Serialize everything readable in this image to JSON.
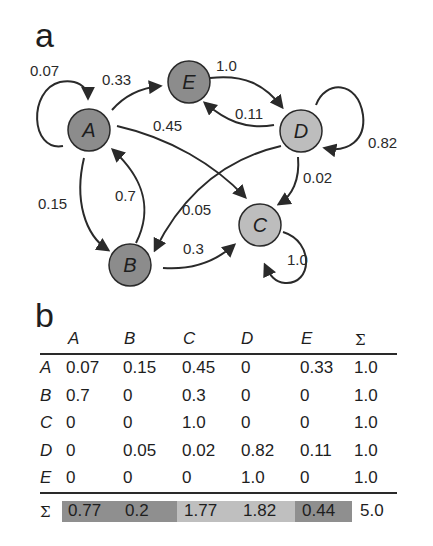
{
  "panels": {
    "a_label": "a",
    "b_label": "b"
  },
  "colors": {
    "node_dark": "#8c8c8c",
    "node_light": "#bdbdbd",
    "stroke": "#2a2a2a",
    "sum_dark": "#8f8f8f",
    "sum_light": "#bfbfbf"
  },
  "graph": {
    "nodes": [
      {
        "id": "A",
        "label": "A",
        "shade": "dark"
      },
      {
        "id": "B",
        "label": "B",
        "shade": "dark"
      },
      {
        "id": "C",
        "label": "C",
        "shade": "light"
      },
      {
        "id": "D",
        "label": "D",
        "shade": "light"
      },
      {
        "id": "E",
        "label": "E",
        "shade": "dark"
      }
    ],
    "edges": [
      {
        "from": "A",
        "to": "A",
        "weight": "0.07"
      },
      {
        "from": "A",
        "to": "E",
        "weight": "0.33"
      },
      {
        "from": "A",
        "to": "C",
        "weight": "0.45"
      },
      {
        "from": "A",
        "to": "B",
        "weight": "0.15"
      },
      {
        "from": "B",
        "to": "A",
        "weight": "0.7"
      },
      {
        "from": "B",
        "to": "C",
        "weight": "0.3"
      },
      {
        "from": "C",
        "to": "C",
        "weight": "1.0"
      },
      {
        "from": "D",
        "to": "D",
        "weight": "0.82"
      },
      {
        "from": "D",
        "to": "E",
        "weight": "0.11"
      },
      {
        "from": "D",
        "to": "C",
        "weight": "0.02"
      },
      {
        "from": "D",
        "to": "B",
        "weight": "0.05"
      },
      {
        "from": "E",
        "to": "D",
        "weight": "1.0"
      }
    ]
  },
  "table": {
    "headers": [
      "A",
      "B",
      "C",
      "D",
      "E",
      "Σ"
    ],
    "rows": [
      {
        "label": "A",
        "values": [
          "0.07",
          "0.15",
          "0.45",
          "0",
          "0.33",
          "1.0"
        ]
      },
      {
        "label": "B",
        "values": [
          "0.7",
          "0",
          "0.3",
          "0",
          "0",
          "1.0"
        ]
      },
      {
        "label": "C",
        "values": [
          "0",
          "0",
          "1.0",
          "0",
          "0",
          "1.0"
        ]
      },
      {
        "label": "D",
        "values": [
          "0",
          "0.05",
          "0.02",
          "0.82",
          "0.11",
          "1.0"
        ]
      },
      {
        "label": "E",
        "values": [
          "0",
          "0",
          "0",
          "1.0",
          "0",
          "1.0"
        ]
      }
    ],
    "sum_row": {
      "label": "Σ",
      "values": [
        "0.77",
        "0.2",
        "1.77",
        "1.82",
        "0.44",
        "5.0"
      ]
    }
  }
}
